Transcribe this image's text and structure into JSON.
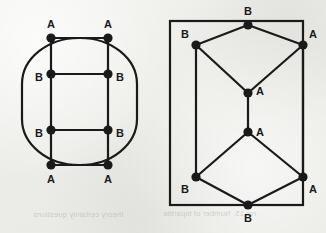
{
  "figure": {
    "caption_bleed_left": "theory certainly questions",
    "caption_bleed_right": "ror 15. Number of bipartite",
    "background_color": "#eeeeeb",
    "ink_color": "#1a1a1a",
    "stroke_width": 2.2,
    "node_radius": 4.6,
    "label_font_size": 11,
    "left_graph": {
      "name": "ladder-in-stadium-graph",
      "outline_shape": "rounded-rectangle",
      "outline": {
        "x": 22,
        "y": 38,
        "width": 115,
        "height": 127,
        "rx": 57,
        "ry": 46
      },
      "nodes": [
        {
          "id": "tl",
          "label": "A",
          "x": 51,
          "y": 38,
          "label_x": 51,
          "label_y": 25
        },
        {
          "id": "tr",
          "label": "A",
          "x": 108,
          "y": 38,
          "label_x": 108,
          "label_y": 25
        },
        {
          "id": "ml",
          "label": "B",
          "x": 51,
          "y": 74,
          "label_x": 39,
          "label_y": 78
        },
        {
          "id": "mr",
          "label": "B",
          "x": 108,
          "y": 74,
          "label_x": 120,
          "label_y": 78
        },
        {
          "id": "nl",
          "label": "B",
          "x": 51,
          "y": 130,
          "label_x": 39,
          "label_y": 134
        },
        {
          "id": "nr",
          "label": "B",
          "x": 108,
          "y": 130,
          "label_x": 120,
          "label_y": 134
        },
        {
          "id": "bl",
          "label": "A",
          "x": 51,
          "y": 165,
          "label_x": 51,
          "label_y": 180
        },
        {
          "id": "br",
          "label": "A",
          "x": 108,
          "y": 165,
          "label_x": 108,
          "label_y": 180
        }
      ],
      "edges": [
        [
          "tl",
          "tr"
        ],
        [
          "ml",
          "mr"
        ],
        [
          "nl",
          "nr"
        ],
        [
          "bl",
          "br"
        ],
        [
          "tl",
          "bl"
        ],
        [
          "tr",
          "br"
        ]
      ]
    },
    "right_graph": {
      "name": "hexagonal-prism-graph",
      "outline_shape": "rectangle",
      "outline": {
        "x": 170,
        "y": 21,
        "width": 133,
        "height": 184
      },
      "nodes": [
        {
          "id": "t",
          "label": "B",
          "x": 248,
          "y": 25,
          "label_x": 248,
          "label_y": 12
        },
        {
          "id": "ul",
          "label": "B",
          "x": 196,
          "y": 45,
          "label_x": 185,
          "label_y": 35
        },
        {
          "id": "ur",
          "label": "A",
          "x": 303,
          "y": 45,
          "label_x": 313,
          "label_y": 35
        },
        {
          "id": "ca",
          "label": "A",
          "x": 248,
          "y": 93,
          "label_x": 260,
          "label_y": 92
        },
        {
          "id": "cb",
          "label": "A",
          "x": 248,
          "y": 132,
          "label_x": 260,
          "label_y": 133
        },
        {
          "id": "ll",
          "label": "B",
          "x": 196,
          "y": 177,
          "label_x": 185,
          "label_y": 190
        },
        {
          "id": "lr",
          "label": "A",
          "x": 303,
          "y": 177,
          "label_x": 313,
          "label_y": 190
        },
        {
          "id": "b",
          "label": "B",
          "x": 248,
          "y": 205,
          "label_x": 248,
          "label_y": 219
        }
      ],
      "edges": [
        [
          "ul",
          "t"
        ],
        [
          "t",
          "ur"
        ],
        [
          "ul",
          "ca"
        ],
        [
          "ca",
          "ur"
        ],
        [
          "ca",
          "cb"
        ],
        [
          "cb",
          "ll"
        ],
        [
          "cb",
          "lr"
        ],
        [
          "ll",
          "b"
        ],
        [
          "b",
          "lr"
        ],
        [
          "ul",
          "ll"
        ],
        [
          "ur",
          "lr"
        ]
      ]
    }
  }
}
